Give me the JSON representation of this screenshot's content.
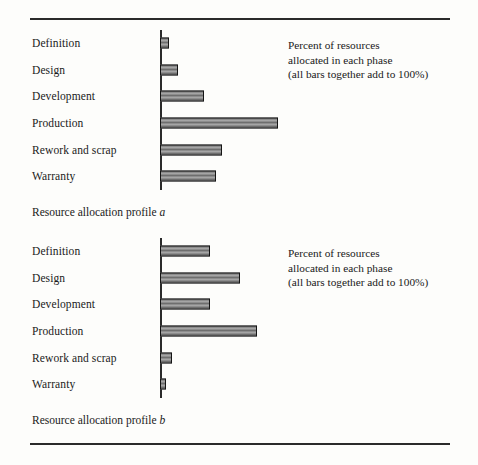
{
  "figure": {
    "background_color": "#fdfdfb",
    "rule_color": "#2a2a2a",
    "bar_fill_color": "#8a8a8a",
    "bar_border_color": "#141414"
  },
  "annotation": {
    "line1": "Percent of resources",
    "line2": "allocated in each phase",
    "line3": "(all bars together add to 100%)"
  },
  "captions": {
    "a_prefix": "Resource allocation profile ",
    "a_italic": "a",
    "b_prefix": "Resource allocation profile ",
    "b_italic": "b"
  },
  "chart_data": [
    {
      "type": "bar",
      "orientation": "horizontal",
      "title": "Resource allocation profile a",
      "xlabel": "Percent of resources allocated in each phase",
      "ylabel": "",
      "grid": false,
      "legend": "none",
      "axis_visible": "y-axis only (vertical baseline at zero)",
      "tick_labels": [],
      "xlim": [
        0,
        100
      ],
      "categories": [
        "Definition",
        "Design",
        "Development",
        "Production",
        "Rework and scrap",
        "Warranty"
      ],
      "values": [
        3,
        6,
        15,
        40,
        21,
        19
      ],
      "units": "percent",
      "annotation": "(all bars together add to 100%)"
    },
    {
      "type": "bar",
      "orientation": "horizontal",
      "title": "Resource allocation profile b",
      "xlabel": "Percent of resources allocated in each phase",
      "ylabel": "",
      "grid": false,
      "legend": "none",
      "axis_visible": "y-axis only (vertical baseline at zero)",
      "tick_labels": [],
      "xlim": [
        0,
        100
      ],
      "categories": [
        "Definition",
        "Design",
        "Development",
        "Production",
        "Rework and scrap",
        "Warranty"
      ],
      "values": [
        17,
        27,
        17,
        33,
        4,
        2
      ],
      "units": "percent",
      "annotation": "(all bars together add to 100%)"
    }
  ],
  "render": {
    "pixels_per_unit": 2.95,
    "charts": [
      {
        "bars_px": [
          13,
          19,
          45,
          120,
          67,
          62
        ]
      },
      {
        "bars_px": [
          40,
          64,
          40,
          96,
          13,
          6
        ]
      }
    ]
  }
}
